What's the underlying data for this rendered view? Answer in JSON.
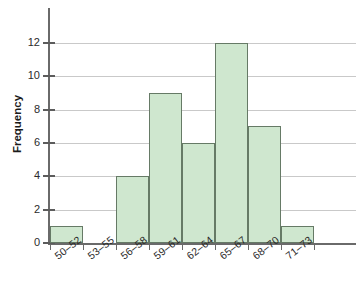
{
  "chart_data": {
    "type": "bar",
    "title": "",
    "xlabel": "",
    "ylabel": "Frequency",
    "categories": [
      "50–52",
      "53–55",
      "56–58",
      "59–61",
      "62–64",
      "65–67",
      "68–70",
      "71–73"
    ],
    "values": [
      1,
      0,
      4,
      9,
      6,
      12,
      7,
      1
    ],
    "ylim": [
      0,
      13
    ],
    "yticks": [
      0,
      2,
      4,
      6,
      8,
      10,
      12
    ],
    "ytick_labels": [
      "0",
      "2",
      "4",
      "6",
      "8",
      "10",
      "12"
    ],
    "grid": "horizontal",
    "legend": "none",
    "bar_fill_color": "#cfe7cf",
    "bar_border_color": "#667a66",
    "gridline_color": "#c9c9c9",
    "axis_color": "#6a6a6a"
  },
  "title_remnant": "·"
}
